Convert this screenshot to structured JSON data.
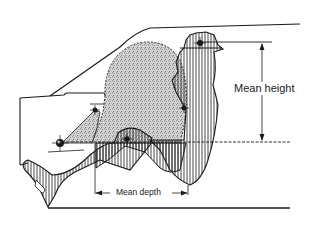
{
  "diagram": {
    "type": "occupant-packaging-side-view",
    "labels": {
      "mean_height": "Mean height",
      "mean_depth": "Mean depth"
    },
    "colors": {
      "line": "#1a1a1a",
      "stipple": "#9a9a9a",
      "background": "#ffffff"
    },
    "markers": [
      {
        "name": "head-point",
        "x": 200,
        "y": 43
      },
      {
        "name": "shoulder-point",
        "x": 184,
        "y": 108
      },
      {
        "name": "steering-point",
        "x": 95,
        "y": 110
      },
      {
        "name": "hip-point",
        "x": 127,
        "y": 139
      },
      {
        "name": "heel-point",
        "x": 60,
        "y": 143
      }
    ]
  }
}
